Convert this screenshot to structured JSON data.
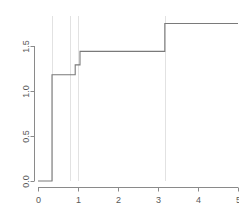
{
  "chart_data": {
    "type": "line",
    "subtype": "step-function",
    "title": "",
    "subtitle": "",
    "xlabel": "",
    "ylabel": "",
    "xlim": [
      0,
      5
    ],
    "ylim": [
      0,
      1.78
    ],
    "grid": false,
    "legend": null,
    "legend_position": "none",
    "axis_style": "r-base-default",
    "x_ticks": [
      0,
      1,
      2,
      3,
      4,
      5
    ],
    "x_tick_labels": [
      "0",
      "1",
      "2",
      "3",
      "4",
      "5"
    ],
    "y_ticks": [
      0.0,
      0.5,
      1.0,
      1.5
    ],
    "y_tick_labels": [
      "0.0",
      "0.5",
      "1.0",
      "1.5"
    ],
    "y_tick_labels_rotated": true,
    "line_color": "#7a7a7a",
    "axis_color": "#8a8a8a",
    "tick_label_color": "#585858",
    "vline_color": "#e2e2e2",
    "step_points": [
      {
        "x": 0.0,
        "y": 0.0
      },
      {
        "x": 0.35,
        "y": 0.0
      },
      {
        "x": 0.35,
        "y": 1.18
      },
      {
        "x": 0.93,
        "y": 1.18
      },
      {
        "x": 0.93,
        "y": 1.29
      },
      {
        "x": 1.05,
        "y": 1.29
      },
      {
        "x": 1.05,
        "y": 1.44
      },
      {
        "x": 3.17,
        "y": 1.44
      },
      {
        "x": 3.17,
        "y": 1.75
      },
      {
        "x": 5.0,
        "y": 1.75
      }
    ],
    "jumps": [
      {
        "x": 0.35,
        "from": 0.0,
        "to": 1.18
      },
      {
        "x": 0.93,
        "from": 1.18,
        "to": 1.29
      },
      {
        "x": 1.05,
        "from": 1.29,
        "to": 1.44
      },
      {
        "x": 3.17,
        "from": 1.44,
        "to": 1.75
      }
    ],
    "vertical_reference_lines": [
      0.35,
      0.8,
      1.0,
      3.17
    ],
    "series": [
      {
        "name": "cumulative-step",
        "x": [
          0.0,
          0.35,
          0.93,
          1.05,
          3.17,
          5.0
        ],
        "values": [
          0.0,
          1.18,
          1.29,
          1.44,
          1.75,
          1.75
        ]
      }
    ]
  }
}
